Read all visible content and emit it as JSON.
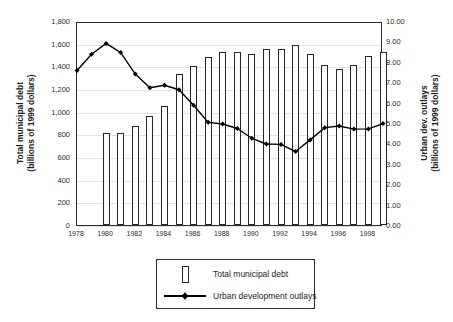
{
  "chart_data": {
    "type": "bar",
    "title": "",
    "subtitle": "",
    "xlabel": "",
    "ylabel": "Total municipal debt (billions of 1999 dollars)",
    "y2label": "Urban dev. outlays (billions of 1999 dollars)",
    "grid": true,
    "legend_position": "bottom",
    "axes": {
      "left": {
        "title_line1": "Total municipal debt",
        "title_line2": "(billions of 1999 dollars)",
        "min": 0,
        "max": 1800,
        "step": 200,
        "ticks": [
          "0",
          "200",
          "400",
          "600",
          "800",
          "1,000",
          "1,200",
          "1,400",
          "1,600",
          "1,800"
        ]
      },
      "right": {
        "title_line1": "Urban dev. outlays",
        "title_line2": "(billions of 1999 dollars)",
        "min": 0,
        "max": 10,
        "step": 1,
        "ticks": [
          "0.00",
          "1.00",
          "2.00",
          "3.00",
          "4.00",
          "5.00",
          "6.00",
          "7.00",
          "8.00",
          "9.00",
          "10.00"
        ]
      },
      "x": {
        "min": 1978,
        "max": 1999,
        "tick_labels": [
          "1978",
          "1980",
          "1982",
          "1984",
          "1986",
          "1988",
          "1990",
          "1992",
          "1994",
          "1996",
          "1998"
        ]
      }
    },
    "x": [
      1978,
      1979,
      1980,
      1981,
      1982,
      1983,
      1984,
      1985,
      1986,
      1987,
      1988,
      1989,
      1990,
      1991,
      1992,
      1993,
      1994,
      1995,
      1996,
      1997,
      1998,
      1999
    ],
    "series": [
      {
        "name": "Total municipal debt",
        "key": "bars",
        "render": "bar",
        "axis": "left",
        "units": "billions of 1999 dollars",
        "points": [
          {
            "year": 1980,
            "value": 810
          },
          {
            "year": 1981,
            "value": 815
          },
          {
            "year": 1982,
            "value": 875
          },
          {
            "year": 1983,
            "value": 965
          },
          {
            "year": 1984,
            "value": 1050
          },
          {
            "year": 1985,
            "value": 1330
          },
          {
            "year": 1986,
            "value": 1400
          },
          {
            "year": 1987,
            "value": 1480
          },
          {
            "year": 1988,
            "value": 1525
          },
          {
            "year": 1989,
            "value": 1525
          },
          {
            "year": 1990,
            "value": 1510
          },
          {
            "year": 1991,
            "value": 1555
          },
          {
            "year": 1992,
            "value": 1550
          },
          {
            "year": 1993,
            "value": 1590
          },
          {
            "year": 1994,
            "value": 1510
          },
          {
            "year": 1995,
            "value": 1410
          },
          {
            "year": 1996,
            "value": 1375
          },
          {
            "year": 1997,
            "value": 1415
          },
          {
            "year": 1998,
            "value": 1495
          },
          {
            "year": 1999,
            "value": 1530
          }
        ]
      },
      {
        "name": "Urban development outlays",
        "key": "line",
        "render": "line",
        "axis": "right",
        "units": "billions of 1999 dollars",
        "points": [
          {
            "year": 1978,
            "value": 7.62
          },
          {
            "year": 1979,
            "value": 8.42
          },
          {
            "year": 1980,
            "value": 8.95
          },
          {
            "year": 1981,
            "value": 8.5
          },
          {
            "year": 1982,
            "value": 7.45
          },
          {
            "year": 1983,
            "value": 6.78
          },
          {
            "year": 1984,
            "value": 6.9
          },
          {
            "year": 1985,
            "value": 6.68
          },
          {
            "year": 1986,
            "value": 5.92
          },
          {
            "year": 1987,
            "value": 5.08
          },
          {
            "year": 1988,
            "value": 5.0
          },
          {
            "year": 1989,
            "value": 4.78
          },
          {
            "year": 1990,
            "value": 4.3
          },
          {
            "year": 1991,
            "value": 4.02
          },
          {
            "year": 1992,
            "value": 4.0
          },
          {
            "year": 1993,
            "value": 3.65
          },
          {
            "year": 1994,
            "value": 4.22
          },
          {
            "year": 1995,
            "value": 4.82
          },
          {
            "year": 1996,
            "value": 4.9
          },
          {
            "year": 1997,
            "value": 4.75
          },
          {
            "year": 1998,
            "value": 4.76
          },
          {
            "year": 1999,
            "value": 5.02
          }
        ]
      }
    ],
    "colors": {
      "bar_fill": "#ffffff",
      "bar_stroke": "#262626",
      "line": "#000000",
      "marker": "#000000",
      "grid": "#e2e2e2",
      "axis": "#2b2b2b",
      "text": "#1a1a1a",
      "background": "#ffffff"
    }
  },
  "legend": {
    "items": [
      {
        "label": "Total municipal debt",
        "key": "bar"
      },
      {
        "label": "Urban development outlays",
        "key": "line"
      }
    ]
  }
}
